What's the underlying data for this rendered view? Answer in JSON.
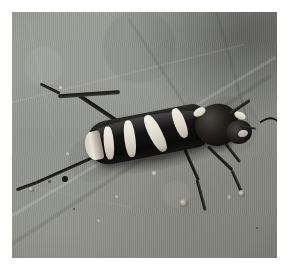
{
  "image": {
    "type": "photograph",
    "subject": "longhorn beetle on a leaf",
    "alt_text": "A black longhorn beetle with four cream-white bands across its elytra, resting on a large gray-green leaf",
    "orientation": "landscape",
    "frame": {
      "border_color": "#ffffff",
      "border_width_px": 12,
      "photo_width_px": 265,
      "photo_height_px": 246
    },
    "palette": {
      "leaf_light": "#9a9c96",
      "leaf_mid": "#8e908b",
      "leaf_dark": "#7d7f78",
      "leaf_shadow": "#5d5f59",
      "beetle_black": "#111110",
      "beetle_band_cream": "#efece2",
      "beetle_highlight": "#4b4843"
    },
    "subject_detail": {
      "body_color": "black",
      "marking_color": "cream white",
      "band_count": 4,
      "antenna_count": 2,
      "visible_legs": 5,
      "pose": "facing right, body angled up toward upper-right"
    },
    "background_detail": {
      "surface": "leaf",
      "surface_color": "gray-green",
      "texture": "fine vertical fibres with diagonal veins",
      "shadow_region": "upper-right corner"
    }
  }
}
